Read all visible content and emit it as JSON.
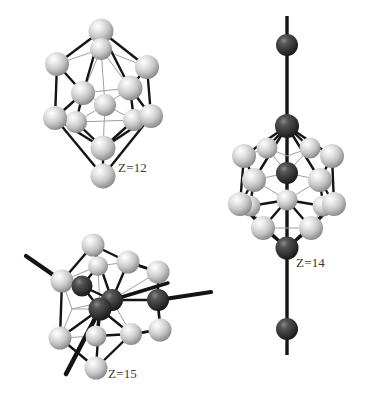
{
  "figure": {
    "background_color": "#ffffff",
    "width": 367,
    "height": 400,
    "colors": {
      "light_atom_base": "#c9c9c9",
      "light_atom_highlight": "#f2f2f2",
      "light_atom_shadow": "#8d8d8d",
      "dark_atom_base": "#3a3a3a",
      "dark_atom_highlight": "#7d7d7d",
      "dark_atom_shadow": "#1a1a1a",
      "bond_strong": "#1a1a1a",
      "bond_faint": "#9a9a9a",
      "label_color": "#3a3a3a"
    }
  },
  "clusters": [
    {
      "id": "z12",
      "label": "Z=12",
      "description": "centered icosahedron, twelve light shell atoms with one light central atom",
      "light_atom_count": 13,
      "dark_atom_count": 0,
      "external_bonds": 0
    },
    {
      "id": "z14",
      "label": "Z=14",
      "description": "icosahedral cluster with dark atoms on a vertical axis, two external dark atoms above and below",
      "light_atom_count": 12,
      "dark_atom_count": 5,
      "external_bonds": 2
    },
    {
      "id": "z15",
      "label": "Z=15",
      "description": "tilted icosahedral cluster with dark atoms and three thick bonds protruding outward",
      "light_atom_count": 11,
      "dark_atom_count": 4,
      "external_bonds": 4
    }
  ]
}
